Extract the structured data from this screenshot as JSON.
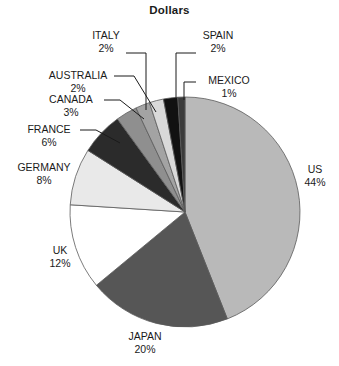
{
  "chart_data": {
    "type": "pie",
    "title": "Dollars",
    "xlabel": "",
    "ylabel": "",
    "legend_position": "none",
    "grid": false,
    "units": "percent",
    "start_angle_deg": 0,
    "direction": "clockwise",
    "categories": [
      "US",
      "JAPAN",
      "UK",
      "GERMANY",
      "FRANCE",
      "CANADA",
      "AUSTRALIA",
      "ITALY",
      "SPAIN",
      "MEXICO"
    ],
    "values": [
      44,
      20,
      12,
      8,
      6,
      3,
      2,
      2,
      2,
      1
    ],
    "slices": [
      {
        "name": "US",
        "value": 44,
        "label": "US",
        "percent_label": "44%",
        "color": "#b9b9b9"
      },
      {
        "name": "JAPAN",
        "value": 20,
        "label": "JAPAN",
        "percent_label": "20%",
        "color": "#565656"
      },
      {
        "name": "UK",
        "value": 12,
        "label": "UK",
        "percent_label": "12%",
        "color": "#ffffff"
      },
      {
        "name": "GERMANY",
        "value": 8,
        "label": "GERMANY",
        "percent_label": "8%",
        "color": "#e9e9e9"
      },
      {
        "name": "FRANCE",
        "value": 6,
        "label": "FRANCE",
        "percent_label": "6%",
        "color": "#2b2b2b"
      },
      {
        "name": "CANADA",
        "value": 3,
        "label": "CANADA",
        "percent_label": "3%",
        "color": "#8f8f8f"
      },
      {
        "name": "AUSTRALIA",
        "value": 2,
        "label": "AUSTRALIA",
        "percent_label": "2%",
        "color": "#a3a3a3"
      },
      {
        "name": "ITALY",
        "value": 2,
        "label": "ITALY",
        "percent_label": "2%",
        "color": "#d9d9d9"
      },
      {
        "name": "SPAIN",
        "value": 2,
        "label": "SPAIN",
        "percent_label": "2%",
        "color": "#111111"
      },
      {
        "name": "MEXICO",
        "value": 1,
        "label": "MEXICO",
        "percent_label": "1%",
        "color": "#3b3b3b"
      }
    ]
  },
  "labels": {
    "us": {
      "name": "US",
      "percent": "44%"
    },
    "japan": {
      "name": "JAPAN",
      "percent": "20%"
    },
    "uk": {
      "name": "UK",
      "percent": "12%"
    },
    "germany": {
      "name": "GERMANY",
      "percent": "8%"
    },
    "france": {
      "name": "FRANCE",
      "percent": "6%"
    },
    "canada": {
      "name": "CANADA",
      "percent": "3%"
    },
    "australia": {
      "name": "AUSTRALIA",
      "percent": "2%"
    },
    "italy": {
      "name": "ITALY",
      "percent": "2%"
    },
    "spain": {
      "name": "SPAIN",
      "percent": "2%"
    },
    "mexico": {
      "name": "MEXICO",
      "percent": "1%"
    }
  }
}
